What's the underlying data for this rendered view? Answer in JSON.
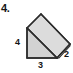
{
  "figure": {
    "problem_number": "4.",
    "shape": "triangular-prism",
    "fills": {
      "front_face": "#d2d2d2",
      "top_slant_face": "#dcdcdc",
      "right_end_face": "#c8c8c8",
      "outline": "#2b2b2b",
      "background": "#ffffff"
    },
    "labels": {
      "left_edge": "4",
      "bottom_edge": "3",
      "depth_edge": "2"
    },
    "dimensions": [
      {
        "name": "height",
        "value": "4",
        "position": "left"
      },
      {
        "name": "base",
        "value": "3",
        "position": "bottom"
      },
      {
        "name": "depth",
        "value": "2",
        "position": "right"
      }
    ]
  }
}
